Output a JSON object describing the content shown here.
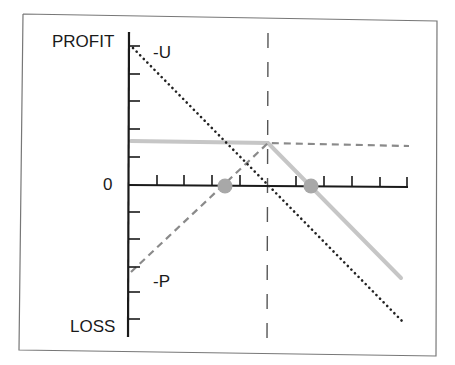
{
  "diagram": {
    "labels": {
      "profit": "PROFIT",
      "loss": "LOSS",
      "zero": "0",
      "upper_intercept": "-U",
      "lower_intercept": "-P"
    },
    "colors": {
      "axis": "#1a1a1a",
      "frame": "#777777",
      "gray_line": "#c4c4c4",
      "dashed_line": "#8a8a8a",
      "dotted_line": "#222222",
      "breakeven_dot": "#a8a8a8"
    },
    "series": [
      {
        "name": "dotted-diagonal",
        "style": "dotted",
        "from": [
          133,
          48
        ],
        "to": [
          403,
          322
        ]
      },
      {
        "name": "gray-solid-flat",
        "style": "solid-gray",
        "from": [
          131,
          141
        ],
        "to": [
          268,
          143
        ]
      },
      {
        "name": "gray-solid-down",
        "style": "solid-gray",
        "from": [
          268,
          143
        ],
        "to": [
          401,
          278
        ]
      },
      {
        "name": "dashed-rising",
        "style": "dashed",
        "from": [
          131,
          272
        ],
        "to": [
          268,
          143
        ]
      },
      {
        "name": "dashed-flat",
        "style": "dashed",
        "from": [
          268,
          143
        ],
        "to": [
          409,
          146
        ]
      }
    ],
    "breakeven_points": [
      [
        225,
        186
      ],
      [
        311,
        186
      ]
    ],
    "strike_line_x": 268
  }
}
